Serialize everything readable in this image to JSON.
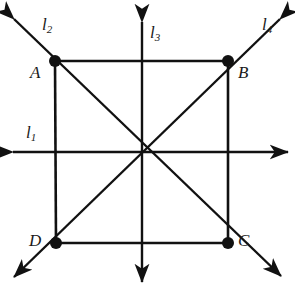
{
  "figure": {
    "type": "geometry-diagram",
    "stroke_color": "#111111",
    "background_color": "#ffffff",
    "canvas": {
      "width": 295,
      "height": 290
    },
    "vertices": [
      {
        "id": "A",
        "label": "A",
        "x": 55,
        "y": 61,
        "label_x": 30,
        "label_y": 64
      },
      {
        "id": "B",
        "label": "B",
        "x": 228,
        "y": 61,
        "label_x": 238,
        "label_y": 64
      },
      {
        "id": "C",
        "label": "C",
        "x": 228,
        "y": 243,
        "label_x": 238,
        "label_y": 236
      },
      {
        "id": "D",
        "label": "D",
        "x": 56,
        "y": 243,
        "label_x": 30,
        "label_y": 236
      }
    ],
    "center": {
      "x": 142,
      "y": 152
    },
    "lines": [
      {
        "id": "l1",
        "label": "l",
        "sub": "1",
        "label_x": 26,
        "label_y": 124,
        "kind": "horizontal"
      },
      {
        "id": "l2",
        "label": "l",
        "sub": "2",
        "label_x": 42,
        "label_y": 16,
        "kind": "diagonal-nwse"
      },
      {
        "id": "l3",
        "label": "l",
        "sub": "3",
        "label_x": 150,
        "label_y": 24,
        "kind": "vertical"
      },
      {
        "id": "l4",
        "label": "l",
        "sub": "4",
        "label_x": 262,
        "label_y": 16,
        "kind": "diagonal-nesw"
      }
    ]
  }
}
